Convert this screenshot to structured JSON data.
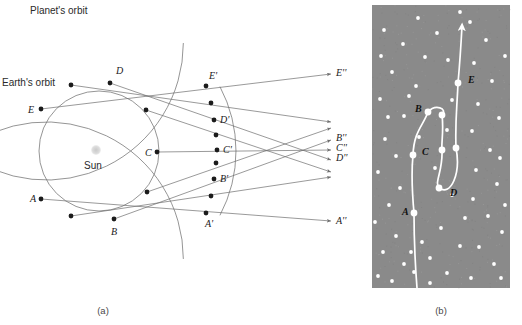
{
  "figure": {
    "panel_a_caption": "(a)",
    "panel_b_caption": "(b)",
    "labels": {
      "planet_orbit": "Planet's orbit",
      "earth_orbit": "Earth's orbit",
      "sun": "Sun"
    }
  },
  "colors": {
    "background": "#ffffff",
    "orbit_line": "#7a7a7a",
    "sight_line": "#6e6e6e",
    "marker": "#1b1b1b",
    "sun": "#d2d2d2",
    "sky_panel": "#8a8a8a",
    "star": "#ffffff",
    "track": "#ffffff",
    "text": "#1a1a1a"
  },
  "panel_a": {
    "earth_positions": [
      {
        "id": "A",
        "label": "A",
        "x": 41,
        "y": 199,
        "label_x": 30,
        "label_y": 202
      },
      {
        "id": "e2",
        "label": "",
        "x": 71,
        "y": 216,
        "label_x": 0,
        "label_y": 0
      },
      {
        "id": "B",
        "label": "B",
        "x": 114,
        "y": 219,
        "label_x": 111,
        "label_y": 235
      },
      {
        "id": "e4",
        "label": "",
        "x": 147,
        "y": 192,
        "label_x": 0,
        "label_y": 0
      },
      {
        "id": "C",
        "label": "C",
        "x": 157,
        "y": 152,
        "label_x": 145,
        "label_y": 156
      },
      {
        "id": "e6",
        "label": "",
        "x": 146,
        "y": 110,
        "label_x": 0,
        "label_y": 0
      },
      {
        "id": "D",
        "label": "D",
        "x": 110,
        "y": 83,
        "label_x": 116,
        "label_y": 74
      },
      {
        "id": "e8",
        "label": "",
        "x": 71,
        "y": 85,
        "label_x": 0,
        "label_y": 0
      },
      {
        "id": "E",
        "label": "E",
        "x": 41,
        "y": 109,
        "label_x": 28,
        "label_y": 113
      }
    ],
    "planet_positions": [
      {
        "id": "A'",
        "label": "A'",
        "x": 206,
        "y": 213,
        "label_x": 205,
        "label_y": 227
      },
      {
        "id": "p2",
        "label": "",
        "x": 211,
        "y": 196,
        "label_x": 0,
        "label_y": 0
      },
      {
        "id": "B'",
        "label": "B'",
        "x": 214,
        "y": 179,
        "label_x": 220,
        "label_y": 182
      },
      {
        "id": "p4",
        "label": "",
        "x": 216,
        "y": 163,
        "label_x": 0,
        "label_y": 0
      },
      {
        "id": "C'",
        "label": "C'",
        "x": 217,
        "y": 150,
        "label_x": 223,
        "label_y": 153
      },
      {
        "id": "p6",
        "label": "",
        "x": 216,
        "y": 135,
        "label_x": 0,
        "label_y": 0
      },
      {
        "id": "D'",
        "label": "D'",
        "x": 214,
        "y": 120,
        "label_x": 220,
        "label_y": 123
      },
      {
        "id": "p8",
        "label": "",
        "x": 211,
        "y": 103,
        "label_x": 0,
        "label_y": 0
      },
      {
        "id": "E'",
        "label": "E'",
        "x": 206,
        "y": 86,
        "label_x": 209,
        "label_y": 79
      }
    ],
    "sky_labels": [
      {
        "id": "E''",
        "label": "E''",
        "x": 336,
        "y": 76
      },
      {
        "id": "B''",
        "label": "B''",
        "x": 336,
        "y": 141
      },
      {
        "id": "C''",
        "label": "C''",
        "x": 336,
        "y": 151
      },
      {
        "id": "D''",
        "label": "D''",
        "x": 336,
        "y": 161
      },
      {
        "id": "A''",
        "label": "A''",
        "x": 336,
        "y": 224
      }
    ],
    "sight_lines": [
      {
        "from": "A",
        "to": "A'",
        "x1": 41,
        "y1": 199,
        "x2": 331,
        "y2": 221
      },
      {
        "from": "B",
        "to": "B'",
        "x1": 114,
        "y1": 219,
        "x2": 331,
        "y2": 140
      },
      {
        "from": "C",
        "to": "C'",
        "x1": 157,
        "y1": 152,
        "x2": 331,
        "y2": 150
      },
      {
        "from": "D",
        "to": "D'",
        "x1": 110,
        "y1": 83,
        "x2": 331,
        "y2": 160
      },
      {
        "from": "E",
        "to": "E'",
        "x1": 41,
        "y1": 109,
        "x2": 331,
        "y2": 74
      },
      {
        "from": "e2",
        "to": "p2",
        "x1": 71,
        "y1": 216,
        "x2": 331,
        "y2": 177
      },
      {
        "from": "e4",
        "to": "p4",
        "x1": 147,
        "y1": 192,
        "x2": 331,
        "y2": 128
      },
      {
        "from": "e6",
        "to": "p6",
        "x1": 146,
        "y1": 110,
        "x2": 331,
        "y2": 172
      },
      {
        "from": "e8",
        "to": "p8",
        "x1": 71,
        "y1": 85,
        "x2": 331,
        "y2": 122
      }
    ],
    "sun": {
      "x": 96,
      "y": 150,
      "r": 5
    },
    "earth_orbit": {
      "cx": 99,
      "cy": 151,
      "r": 60
    },
    "planet_orbit": {
      "cx": 99,
      "cy": 151,
      "r": 137
    }
  },
  "panel_b": {
    "rect": {
      "x": 372,
      "y": 5,
      "width": 138,
      "height": 283
    },
    "track_points": [
      {
        "id": "A",
        "label": "A",
        "x": 414,
        "y": 213,
        "label_x": 402,
        "label_y": 215
      },
      {
        "id": "C",
        "label": "C",
        "x": 413,
        "y": 155,
        "label_x": 422,
        "label_y": 155
      },
      {
        "id": "B",
        "label": "B",
        "x": 428,
        "y": 112,
        "label_x": 415,
        "label_y": 112
      },
      {
        "id": "n4",
        "label": "",
        "x": 442,
        "y": 115,
        "label_x": 0,
        "label_y": 0
      },
      {
        "id": "n5",
        "label": "",
        "x": 442,
        "y": 150,
        "label_x": 0,
        "label_y": 0
      },
      {
        "id": "D",
        "label": "D",
        "x": 439,
        "y": 188,
        "label_x": 450,
        "label_y": 196
      },
      {
        "id": "n7",
        "label": "",
        "x": 456,
        "y": 148,
        "label_x": 0,
        "label_y": 0
      },
      {
        "id": "E",
        "label": "E",
        "x": 458,
        "y": 83,
        "label_x": 468,
        "label_y": 83
      }
    ],
    "star_count": 60,
    "stars": [
      {
        "x": 384,
        "y": 30
      },
      {
        "x": 403,
        "y": 44
      },
      {
        "x": 392,
        "y": 72
      },
      {
        "x": 380,
        "y": 99
      },
      {
        "x": 404,
        "y": 116
      },
      {
        "x": 385,
        "y": 139
      },
      {
        "x": 396,
        "y": 156
      },
      {
        "x": 378,
        "y": 172
      },
      {
        "x": 400,
        "y": 188
      },
      {
        "x": 389,
        "y": 205
      },
      {
        "x": 375,
        "y": 222
      },
      {
        "x": 396,
        "y": 236
      },
      {
        "x": 383,
        "y": 252
      },
      {
        "x": 404,
        "y": 264
      },
      {
        "x": 378,
        "y": 276
      },
      {
        "x": 392,
        "y": 281
      },
      {
        "x": 418,
        "y": 18
      },
      {
        "x": 437,
        "y": 33
      },
      {
        "x": 425,
        "y": 57
      },
      {
        "x": 448,
        "y": 60
      },
      {
        "x": 416,
        "y": 86
      },
      {
        "x": 452,
        "y": 100
      },
      {
        "x": 419,
        "y": 137
      },
      {
        "x": 435,
        "y": 168
      },
      {
        "x": 422,
        "y": 242
      },
      {
        "x": 441,
        "y": 228
      },
      {
        "x": 430,
        "y": 258
      },
      {
        "x": 447,
        "y": 273
      },
      {
        "x": 414,
        "y": 272
      },
      {
        "x": 460,
        "y": 246
      },
      {
        "x": 470,
        "y": 22
      },
      {
        "x": 486,
        "y": 40
      },
      {
        "x": 474,
        "y": 63
      },
      {
        "x": 492,
        "y": 81
      },
      {
        "x": 478,
        "y": 104
      },
      {
        "x": 499,
        "y": 118
      },
      {
        "x": 472,
        "y": 131
      },
      {
        "x": 490,
        "y": 150
      },
      {
        "x": 476,
        "y": 170
      },
      {
        "x": 497,
        "y": 184
      },
      {
        "x": 473,
        "y": 199
      },
      {
        "x": 488,
        "y": 216
      },
      {
        "x": 502,
        "y": 232
      },
      {
        "x": 479,
        "y": 247
      },
      {
        "x": 494,
        "y": 264
      },
      {
        "x": 471,
        "y": 278
      },
      {
        "x": 505,
        "y": 56
      },
      {
        "x": 460,
        "y": 12
      },
      {
        "x": 500,
        "y": 158
      },
      {
        "x": 465,
        "y": 218
      },
      {
        "x": 452,
        "y": 195
      },
      {
        "x": 409,
        "y": 96
      },
      {
        "x": 388,
        "y": 117
      },
      {
        "x": 447,
        "y": 130
      },
      {
        "x": 505,
        "y": 205
      },
      {
        "x": 463,
        "y": 290
      },
      {
        "x": 381,
        "y": 56
      },
      {
        "x": 430,
        "y": 283
      },
      {
        "x": 501,
        "y": 278
      },
      {
        "x": 411,
        "y": 252
      }
    ]
  }
}
